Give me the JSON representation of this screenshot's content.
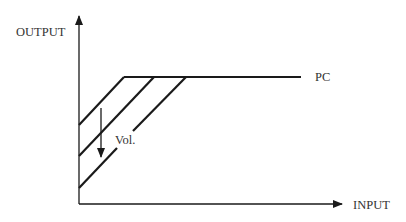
{
  "diagram": {
    "y_axis_label": "OUTPUT",
    "x_axis_label": "INPUT",
    "curve_label": "PC",
    "arrow_label": "Vol.",
    "line_color": "#1a1a1a",
    "text_color": "#333333"
  }
}
